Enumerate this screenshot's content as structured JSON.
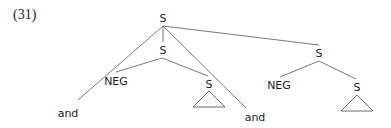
{
  "example_number": "(31)",
  "tree": {
    "root": {
      "label": "S",
      "x": 163,
      "y": 22
    },
    "nodes": [
      {
        "id": "s_mid",
        "label": "S",
        "x": 163,
        "y": 54
      },
      {
        "id": "neg_left",
        "label": "NEG",
        "x": 116,
        "y": 85
      },
      {
        "id": "s_left_inner",
        "label": "S",
        "x": 209,
        "y": 88
      },
      {
        "id": "and_left",
        "label": "and",
        "x": 68,
        "y": 117
      },
      {
        "id": "and_right",
        "label": "and",
        "x": 254,
        "y": 121
      },
      {
        "id": "s_right",
        "label": "S",
        "x": 319,
        "y": 57
      },
      {
        "id": "neg_right",
        "label": "NEG",
        "x": 279,
        "y": 89
      },
      {
        "id": "s_right_inner",
        "label": "S",
        "x": 357,
        "y": 91
      }
    ],
    "edges": [
      {
        "from": "root",
        "to": "s_mid"
      },
      {
        "from": "root",
        "to": "and_left"
      },
      {
        "from": "root",
        "to": "and_right"
      },
      {
        "from": "root",
        "to": "s_right"
      },
      {
        "from": "s_mid",
        "to": "neg_left"
      },
      {
        "from": "s_mid",
        "to": "s_left_inner"
      },
      {
        "from": "s_right",
        "to": "neg_right"
      },
      {
        "from": "s_right",
        "to": "s_right_inner"
      }
    ],
    "triangles": [
      {
        "under": "s_left_inner"
      },
      {
        "under": "s_right_inner"
      }
    ]
  }
}
